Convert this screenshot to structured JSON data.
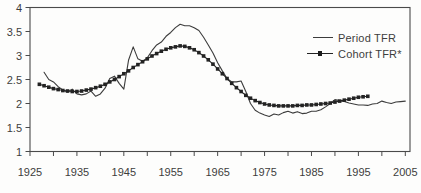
{
  "chart_data": {
    "type": "line",
    "title": "",
    "xlabel": "",
    "ylabel": "",
    "xlim": [
      1925,
      2006
    ],
    "ylim": [
      1,
      4
    ],
    "x_major_ticks": [
      1925,
      1935,
      1945,
      1955,
      1965,
      1975,
      1985,
      1995,
      2005
    ],
    "x_minor_tick_step": 5,
    "y_ticks": [
      1,
      1.5,
      2,
      2.5,
      3,
      3.5,
      4
    ],
    "y_tick_labels": [
      "1",
      "1.5",
      "2",
      "2.5",
      "3",
      "3.5",
      "4"
    ],
    "grid": false,
    "frame": "full-box",
    "legend_position": "top-right-inside",
    "colors": {
      "axis": "#4a4a4a",
      "tick_label": "#3d3d3d",
      "period_line": "#3c3c3c",
      "cohort_line": "#232323",
      "background": "#fdfdfc"
    },
    "series": [
      {
        "name": "Period TFR",
        "type": "line",
        "marker": "none",
        "color": "#3c3c3c",
        "x_start": 1928,
        "x_step": 1,
        "values": [
          2.65,
          2.5,
          2.45,
          2.35,
          2.28,
          2.24,
          2.3,
          2.2,
          2.18,
          2.2,
          2.26,
          2.15,
          2.2,
          2.32,
          2.52,
          2.57,
          2.42,
          2.3,
          2.9,
          3.18,
          2.93,
          2.88,
          2.95,
          3.1,
          3.22,
          3.28,
          3.4,
          3.48,
          3.58,
          3.65,
          3.62,
          3.62,
          3.58,
          3.52,
          3.38,
          3.22,
          3.05,
          2.85,
          2.68,
          2.52,
          2.45,
          2.45,
          2.47,
          2.25,
          2.0,
          1.86,
          1.8,
          1.76,
          1.73,
          1.78,
          1.76,
          1.81,
          1.84,
          1.8,
          1.83,
          1.79,
          1.8,
          1.84,
          1.84,
          1.87,
          1.93,
          2.0,
          2.08,
          2.06,
          2.04,
          2.01,
          1.99,
          1.97,
          1.97,
          1.96,
          1.99,
          2.0,
          2.05,
          2.02,
          2.0,
          2.03,
          2.04,
          2.05
        ]
      },
      {
        "name": "Cohort TFR*",
        "type": "line",
        "marker": "square",
        "color": "#232323",
        "x_start": 1927,
        "x_step": 1,
        "values": [
          2.4,
          2.37,
          2.34,
          2.31,
          2.29,
          2.27,
          2.26,
          2.25,
          2.25,
          2.26,
          2.28,
          2.3,
          2.33,
          2.36,
          2.4,
          2.45,
          2.5,
          2.56,
          2.62,
          2.68,
          2.75,
          2.81,
          2.87,
          2.93,
          2.99,
          3.04,
          3.09,
          3.13,
          3.16,
          3.18,
          3.2,
          3.19,
          3.16,
          3.12,
          3.06,
          2.99,
          2.91,
          2.82,
          2.72,
          2.62,
          2.52,
          2.42,
          2.33,
          2.25,
          2.17,
          2.11,
          2.06,
          2.02,
          1.99,
          1.97,
          1.96,
          1.95,
          1.95,
          1.95,
          1.95,
          1.96,
          1.96,
          1.97,
          1.97,
          1.98,
          1.99,
          2.0,
          2.01,
          2.03,
          2.05,
          2.07,
          2.09,
          2.11,
          2.13,
          2.14,
          2.15
        ]
      }
    ]
  }
}
